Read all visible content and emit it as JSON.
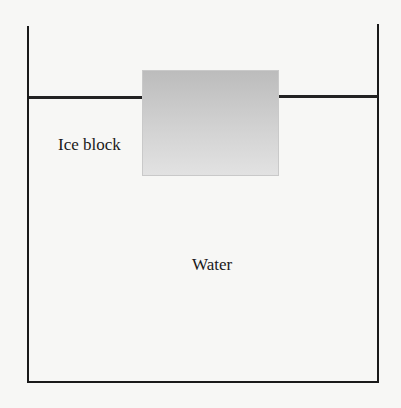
{
  "diagram": {
    "labels": {
      "ice_block": "Ice block",
      "water": "Water"
    },
    "colors": {
      "line": "#1a1a1a",
      "ice_top": "#bcbcbc",
      "ice_bottom": "#e2e2e2",
      "background": "#f7f7f5"
    }
  }
}
